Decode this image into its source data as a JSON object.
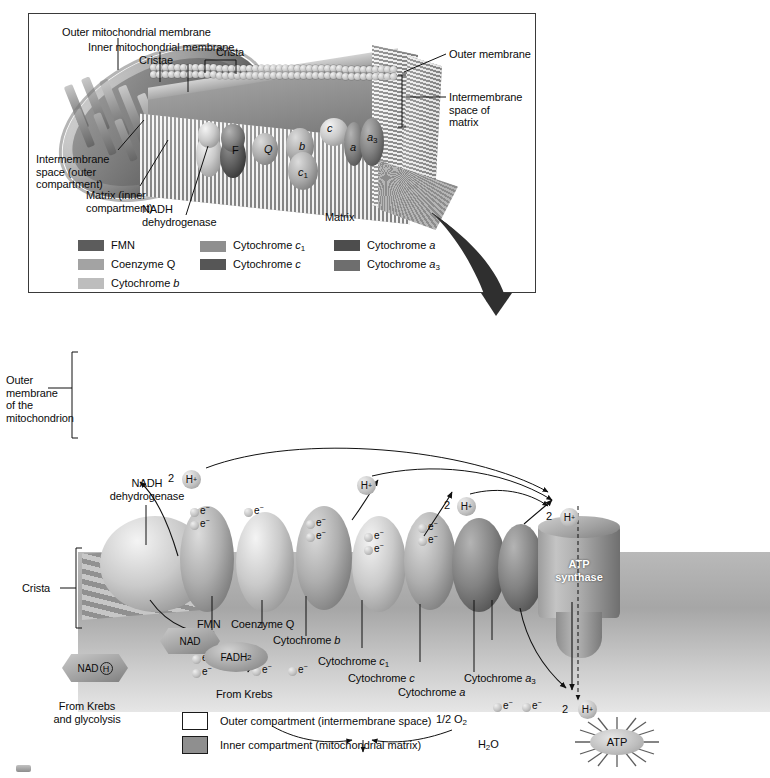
{
  "figure": {
    "title_domain": "mitochondrion-electron-transport-chain",
    "top_panel": {
      "labels": {
        "outer_mitochondrial_membrane": "Outer mitochondrial membrane",
        "inner_mitochondrial_membrane": "Inner mitochondrial membrane",
        "cristae": "Cristae",
        "crista": "Crista",
        "outer_membrane": "Outer membrane",
        "intermembrane_space_of_matrix": "Intermembrane\nspace of\nmatrix",
        "intermembrane_space_outer": "Intermembrane\nspace (outer\ncompartment)",
        "matrix_inner": "Matrix (inner\ncompartment)",
        "nadh_dehydrogenase": "NADH\ndehydrogenase",
        "matrix": "Matrix"
      },
      "complex_tags": [
        {
          "tag": "F",
          "italic": false
        },
        {
          "tag": "Q",
          "italic": true
        },
        {
          "tag": "b",
          "italic": true
        },
        {
          "tag": "c",
          "italic": true
        },
        {
          "tag": "c",
          "sub": "1",
          "italic": true
        },
        {
          "tag": "a",
          "italic": true
        },
        {
          "tag": "a",
          "sub": "3",
          "italic": true
        }
      ]
    },
    "legend_components": {
      "columns": [
        [
          {
            "label": "FMN",
            "italic_part": "",
            "color": "#5c5c5c"
          },
          {
            "label": "Coenzyme Q",
            "italic_part": "",
            "color": "#a3a3a3"
          },
          {
            "label": "Cytochrome ",
            "italic_part": "b",
            "color": "#bdbdbd"
          }
        ],
        [
          {
            "label": "Cytochrome ",
            "italic_part": "c",
            "sub": "1",
            "color": "#8f8f8f"
          },
          {
            "label": "Cytochrome ",
            "italic_part": "c",
            "color": "#565656"
          }
        ],
        [
          {
            "label": "Cytochrome ",
            "italic_part": "a",
            "color": "#4d4d4d"
          },
          {
            "label": "Cytochrome ",
            "italic_part": "a",
            "sub": "3",
            "color": "#6e6e6e"
          }
        ]
      ]
    },
    "lower_panel": {
      "outer_membrane_label": "Outer\nmembrane\nof the\nmitochondrion",
      "crista_label": "Crista",
      "nadh_dehydrogenase_label": "NADH\ndehydrogenase",
      "atp_synthase_label": "ATP\nsynthase",
      "proton_tokens": [
        {
          "count": "2",
          "symbol": "H",
          "charge": "+"
        },
        {
          "count": "",
          "symbol": "H",
          "charge": "+"
        },
        {
          "count": "2",
          "symbol": "H",
          "charge": "+"
        },
        {
          "count": "2",
          "symbol": "H",
          "charge": "+"
        },
        {
          "count": "2",
          "symbol": "H",
          "charge": "+"
        }
      ],
      "electron_label": "e",
      "electron_charge": "−",
      "carriers": {
        "nadh": "NAD",
        "nadh_h": "H",
        "nad": "NAD",
        "fadh2": "FADH",
        "fadh2_sub": "2"
      },
      "source_labels": {
        "from_krebs_glycolysis": "From Krebs\nand glycolysis",
        "from_krebs": "From Krebs"
      },
      "chain_labels": [
        {
          "text": "FMN",
          "italic_part": ""
        },
        {
          "text": "Coenzyme Q",
          "italic_part": ""
        },
        {
          "text": "Cytochrome ",
          "italic_part": "b"
        },
        {
          "text": "Cytochrome ",
          "italic_part": "c",
          "sub": "1"
        },
        {
          "text": "Cytochrome ",
          "italic_part": "c"
        },
        {
          "text": "Cytochrome ",
          "italic_part": "a"
        },
        {
          "text": "Cytochrome ",
          "italic_part": "a",
          "sub": "3"
        }
      ],
      "oxygen_label": "1/2 O",
      "oxygen_sub": "2",
      "water_label": "H",
      "water_sub": "2",
      "water_label2": "O",
      "atp_label": "ATP"
    },
    "compartment_legend": [
      {
        "label": "Outer compartment (intermembrane space)",
        "color": "#ffffff"
      },
      {
        "label": "Inner compartment (mitochondrial matrix)",
        "color": "#8f8f8f"
      }
    ]
  },
  "colors": {
    "ink": "#0b0b0b",
    "panel_border": "#3a3a3a",
    "membrane_head": "#d8d8d8",
    "matrix_gray": "#8f8f8f",
    "arrow": "#2b2b2b"
  }
}
